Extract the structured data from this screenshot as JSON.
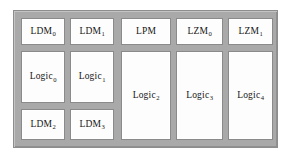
{
  "diagram": {
    "colors": {
      "frame": "#a9a9a9",
      "block_fill": "#fdfdfd",
      "block_border": "#8a8a8a",
      "label_text": "#151515"
    },
    "columns": [
      {
        "id": "column-1",
        "blocks": [
          {
            "id": "ldm-0",
            "base": "LDM",
            "sub": "0",
            "row": "top"
          },
          {
            "id": "logic-0",
            "base": "Logic",
            "sub": "0",
            "row": "mid"
          },
          {
            "id": "ldm-2",
            "base": "LDM",
            "sub": "2",
            "row": "bottom"
          }
        ]
      },
      {
        "id": "column-2",
        "blocks": [
          {
            "id": "ldm-1",
            "base": "LDM",
            "sub": "1",
            "row": "top"
          },
          {
            "id": "logic-1",
            "base": "Logic",
            "sub": "1",
            "row": "mid"
          },
          {
            "id": "ldm-3",
            "base": "LDM",
            "sub": "3",
            "row": "bottom"
          }
        ]
      },
      {
        "id": "column-3",
        "blocks": [
          {
            "id": "lpm",
            "base": "LPM",
            "sub": "",
            "row": "top"
          },
          {
            "id": "logic-2",
            "base": "Logic",
            "sub": "2",
            "row": "tall"
          }
        ]
      },
      {
        "id": "column-4",
        "blocks": [
          {
            "id": "lzm-0",
            "base": "LZM",
            "sub": "0",
            "row": "top"
          },
          {
            "id": "logic-3",
            "base": "Logic",
            "sub": "3",
            "row": "tall"
          }
        ]
      },
      {
        "id": "column-5",
        "blocks": [
          {
            "id": "lzm-1",
            "base": "LZM",
            "sub": "1",
            "row": "top"
          },
          {
            "id": "logic-4",
            "base": "Logic",
            "sub": "4",
            "row": "tall"
          }
        ]
      }
    ]
  }
}
